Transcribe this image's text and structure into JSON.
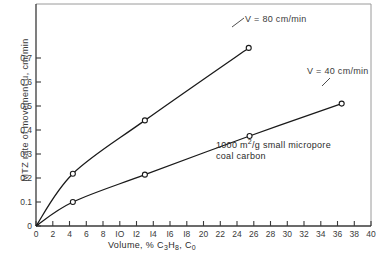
{
  "chart_data": {
    "type": "line",
    "title": "",
    "xlabel": "Volume, % C3H8, C0",
    "ylabel": "MTZ rate of movement u, cm/min",
    "xlim": [
      0,
      40
    ],
    "ylim": [
      0,
      0.78
    ],
    "xticks": [
      0,
      2,
      4,
      6,
      8,
      10,
      12,
      14,
      16,
      18,
      20,
      22,
      24,
      26,
      28,
      30,
      32,
      34,
      36,
      38,
      40
    ],
    "xticklabels": [
      "0",
      "2",
      "4",
      "6",
      "8",
      "IO",
      "I2",
      "I4",
      "I6",
      "I8",
      "20",
      "22",
      "24",
      "26",
      "28",
      "30",
      "32",
      "34",
      "36",
      "38",
      "40"
    ],
    "yticks": [
      0,
      0.1,
      0.2,
      0.3,
      0.4,
      0.5,
      0.6,
      0.7
    ],
    "yticklabels": [
      "0",
      "0.1",
      "0.2",
      "0.3",
      "0.4",
      "0.5",
      "0.6",
      "0.7"
    ],
    "grid": false,
    "legend_position": "inline-annotation",
    "marker": "open-circle",
    "series": [
      {
        "name": "V = 80 cm/min",
        "label": "V = 80 cm/min",
        "color": "#1a1a1a",
        "points": [
          {
            "x": 0.0,
            "y": 0.0
          },
          {
            "x": 4.4,
            "y": 0.218
          },
          {
            "x": 13.0,
            "y": 0.44
          },
          {
            "x": 25.4,
            "y": 0.742
          }
        ]
      },
      {
        "name": "V = 40 cm/min",
        "label": "V = 40 cm/min",
        "color": "#1a1a1a",
        "points": [
          {
            "x": 0.0,
            "y": 0.0
          },
          {
            "x": 4.4,
            "y": 0.1
          },
          {
            "x": 13.0,
            "y": 0.214
          },
          {
            "x": 25.5,
            "y": 0.375
          },
          {
            "x": 36.5,
            "y": 0.51
          }
        ]
      }
    ],
    "annotations": [
      {
        "name": "sample-note",
        "line1": "1000 m2/g small micropore",
        "line2": "coal carbon"
      }
    ]
  },
  "axis": {
    "y_title_text": "MTZ rate of movement u, cm/min",
    "x_title_prefix": "Volume, % C",
    "x_title_sub1": "3",
    "x_title_mid": "H",
    "x_title_sub2": "8",
    "x_title_suffix": ", C",
    "x_title_sub3": "0"
  },
  "annotation": {
    "note_prefix": "1000 m",
    "note_sup": "2",
    "note_rest": "/g small micropore",
    "note_line2": "coal carbon"
  },
  "labels": {
    "series_80": "V = 80 cm/min",
    "series_40": "V = 40 cm/min"
  }
}
